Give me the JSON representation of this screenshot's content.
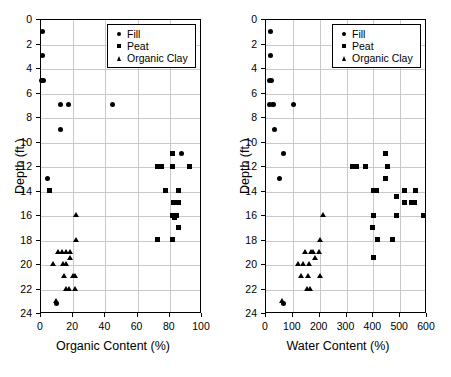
{
  "figure": {
    "title": "",
    "panels": [
      "organic-content-vs-depth",
      "water-content-vs-depth"
    ]
  },
  "legend": {
    "position": "top-right-inside",
    "entries": [
      {
        "label": "Fill",
        "marker": "circle"
      },
      {
        "label": "Peat",
        "marker": "square"
      },
      {
        "label": "Organic Clay",
        "marker": "triangle"
      }
    ]
  },
  "chart_data": [
    {
      "type": "scatter",
      "title": "",
      "xlabel": "Organic Content (%)",
      "ylabel": "Depth (ft.)",
      "xlim": [
        0,
        100
      ],
      "ylim": [
        24,
        0
      ],
      "y_inverted": true,
      "xticks": [
        0,
        20,
        40,
        60,
        80,
        100
      ],
      "yticks": [
        0,
        2,
        4,
        6,
        8,
        10,
        12,
        14,
        16,
        18,
        20,
        22,
        24
      ],
      "grid": true,
      "legend": [
        "Fill",
        "Peat",
        "Organic Clay"
      ],
      "series": [
        {
          "name": "Fill",
          "marker": "circle",
          "points": [
            [
              1.5,
              1
            ],
            [
              1.5,
              3
            ],
            [
              0.8,
              5
            ],
            [
              2.2,
              5
            ],
            [
              12.5,
              7
            ],
            [
              17.5,
              7
            ],
            [
              45,
              7
            ],
            [
              12.5,
              9
            ],
            [
              4.5,
              13
            ],
            [
              10,
              23.2
            ],
            [
              88,
              11
            ]
          ]
        },
        {
          "name": "Peat",
          "marker": "square",
          "points": [
            [
              82,
              11
            ],
            [
              73,
              12
            ],
            [
              75.5,
              12
            ],
            [
              82,
              12
            ],
            [
              93,
              12
            ],
            [
              6,
              14
            ],
            [
              78,
              14
            ],
            [
              86,
              14
            ],
            [
              83,
              15
            ],
            [
              86,
              15
            ],
            [
              82.5,
              16
            ],
            [
              84.5,
              16
            ],
            [
              83.5,
              16.2
            ],
            [
              86,
              17
            ],
            [
              73,
              18
            ],
            [
              82,
              18
            ]
          ]
        },
        {
          "name": "Organic Clay",
          "marker": "triangle",
          "points": [
            [
              22.5,
              16
            ],
            [
              22.5,
              18
            ],
            [
              11,
              19
            ],
            [
              13.5,
              19
            ],
            [
              16.5,
              19
            ],
            [
              18.5,
              19
            ],
            [
              8,
              20
            ],
            [
              14.5,
              20
            ],
            [
              16.5,
              20
            ],
            [
              18.5,
              19.5
            ],
            [
              15,
              21
            ],
            [
              20.5,
              21
            ],
            [
              22,
              21
            ],
            [
              16.5,
              22
            ],
            [
              18,
              22
            ],
            [
              21.5,
              22
            ],
            [
              10,
              23
            ]
          ]
        }
      ]
    },
    {
      "type": "scatter",
      "title": "",
      "xlabel": "Water Content (%)",
      "ylabel": "Depth (ft.)",
      "xlim": [
        0,
        600
      ],
      "ylim": [
        24,
        0
      ],
      "y_inverted": true,
      "xticks": [
        0,
        100,
        200,
        300,
        400,
        500,
        600
      ],
      "yticks": [
        0,
        2,
        4,
        6,
        8,
        10,
        12,
        14,
        16,
        18,
        20,
        22,
        24
      ],
      "grid": true,
      "legend": [
        "Fill",
        "Peat",
        "Organic Clay"
      ],
      "series": [
        {
          "name": "Fill",
          "marker": "circle",
          "points": [
            [
              22,
              1
            ],
            [
              22,
              3
            ],
            [
              18,
              5
            ],
            [
              24,
              5
            ],
            [
              18,
              7
            ],
            [
              30,
              7
            ],
            [
              105,
              7
            ],
            [
              35,
              9
            ],
            [
              70,
              11
            ],
            [
              55,
              13
            ],
            [
              68,
              23.2
            ]
          ]
        },
        {
          "name": "Peat",
          "marker": "square",
          "points": [
            [
              325,
              12
            ],
            [
              340,
              12
            ],
            [
              375,
              12
            ],
            [
              455,
              12
            ],
            [
              450,
              11
            ],
            [
              450,
              13
            ],
            [
              405,
              14
            ],
            [
              415,
              14
            ],
            [
              520,
              14
            ],
            [
              560,
              14
            ],
            [
              490,
              14.5
            ],
            [
              520,
              15
            ],
            [
              545,
              15
            ],
            [
              558,
              15
            ],
            [
              405,
              16
            ],
            [
              490,
              16
            ],
            [
              590,
              16
            ],
            [
              400,
              17
            ],
            [
              420,
              18
            ],
            [
              475,
              18
            ],
            [
              405,
              19.5
            ]
          ]
        },
        {
          "name": "Organic Clay",
          "marker": "triangle",
          "points": [
            [
              215,
              16
            ],
            [
              205,
              18
            ],
            [
              150,
              19
            ],
            [
              170,
              19
            ],
            [
              178,
              19
            ],
            [
              200,
              19
            ],
            [
              122,
              20
            ],
            [
              143,
              20
            ],
            [
              165,
              20
            ],
            [
              185,
              19.5
            ],
            [
              133,
              21
            ],
            [
              160,
              21
            ],
            [
              205,
              21
            ],
            [
              158,
              22
            ],
            [
              168,
              22
            ],
            [
              65,
              23
            ]
          ]
        }
      ]
    }
  ]
}
